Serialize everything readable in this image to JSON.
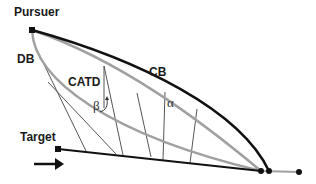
{
  "diagram": {
    "labels": {
      "pursuer": "Pursuer",
      "target": "Target",
      "db": "DB",
      "cb": "CB",
      "catd": "CATD",
      "alpha": "α",
      "beta": "β"
    },
    "colors": {
      "black_path": "#111111",
      "gray_path": "#a0a0a0",
      "thin_line": "#555555"
    },
    "icons": {
      "pursuer_marker": "square",
      "target_marker": "square",
      "motion_arrow": "arrow-right",
      "intercept_points": "circles"
    }
  }
}
